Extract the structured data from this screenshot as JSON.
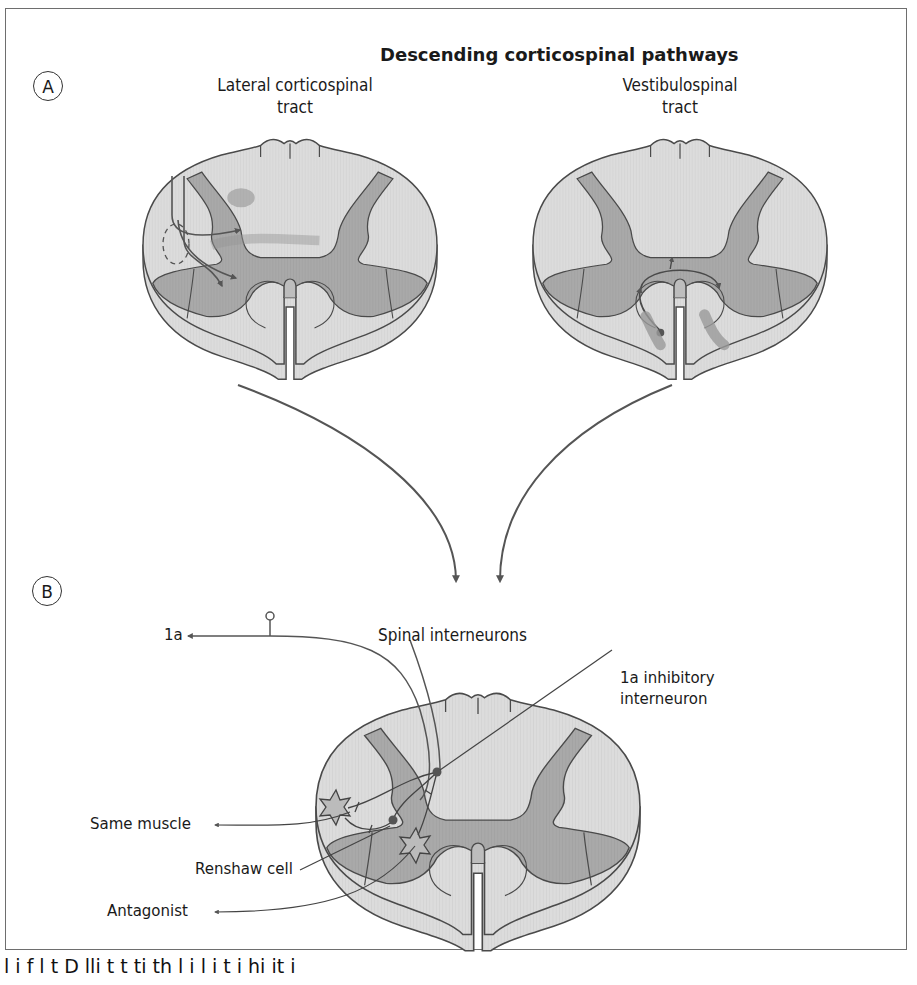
{
  "figure": {
    "title": "Descending corticospinal pathways",
    "panel_a": {
      "marker": "A",
      "left_label_line1": "Lateral corticospinal",
      "left_label_line2": "tract",
      "right_label_line1": "Vestibulospinal",
      "right_label_line2": "tract"
    },
    "panel_b": {
      "marker": "B",
      "heading": "Spinal interneurons",
      "labels": {
        "afferent": "1a",
        "inhibitory_line1": "1a inhibitory",
        "inhibitory_line2": "interneuron",
        "same_muscle": "Same muscle",
        "renshaw": "Renshaw cell",
        "antagonist": "Antagonist"
      }
    },
    "colors": {
      "white_matter": "#d9d9d9",
      "gray_matter": "#a6a6a6",
      "dark_region": "#8f8f8f",
      "outline": "#4a4a4a",
      "arrow": "#555555",
      "frame": "#6e6e6e"
    },
    "caption_fragment": "l  i  f       l  t     D        lli   t  t    ti   th      l    i  l i t          i  hi it   i"
  }
}
